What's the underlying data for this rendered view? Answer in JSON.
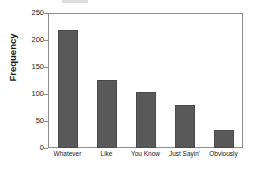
{
  "chart_data": {
    "type": "bar",
    "title": "",
    "xlabel": "",
    "ylabel": "Frequency",
    "categories": [
      "Whatever",
      "Like",
      "You Know",
      "Just Sayin'",
      "Obviously"
    ],
    "values": [
      219,
      126,
      104,
      80,
      33
    ],
    "ylim": [
      0,
      250
    ],
    "yticks": [
      0,
      50,
      100,
      150,
      200,
      250
    ],
    "ytick_labels": [
      "0",
      "50",
      "100",
      "150",
      "200",
      "250"
    ],
    "grid": false,
    "legend": null,
    "bar_color": "#595959",
    "frame_color": "#8c8c8c",
    "text_color": "#1a1a1a",
    "background": "#ffffff"
  }
}
